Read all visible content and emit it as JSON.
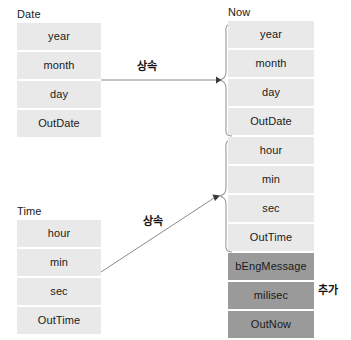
{
  "diagram": {
    "title_date": "Date",
    "title_time": "Time",
    "title_now": "Now"
  },
  "date_class": {
    "name": "Date",
    "fields": [
      {
        "label": "year"
      },
      {
        "label": "month"
      },
      {
        "label": "day"
      },
      {
        "label": "OutDate"
      }
    ]
  },
  "time_class": {
    "name": "Time",
    "fields": [
      {
        "label": "hour"
      },
      {
        "label": "min"
      },
      {
        "label": "sec"
      },
      {
        "label": "OutTime"
      }
    ]
  },
  "now_class": {
    "name": "Now",
    "inherited_from_date": [
      {
        "label": "year"
      },
      {
        "label": "month"
      },
      {
        "label": "day"
      },
      {
        "label": "OutDate"
      }
    ],
    "inherited_from_time": [
      {
        "label": "hour"
      },
      {
        "label": "min"
      },
      {
        "label": "sec"
      },
      {
        "label": "OutTime"
      }
    ],
    "added": [
      {
        "label": "bEngMessage"
      },
      {
        "label": "milisec"
      },
      {
        "label": "OutNow"
      }
    ]
  },
  "edges": [
    {
      "label": "상속"
    },
    {
      "label": "상속"
    }
  ],
  "annotations": {
    "added_label": "추가"
  },
  "colors": {
    "field_fill": "#e9e9e9",
    "added_fill": "#9a9a9a",
    "text": "#1a1a1a",
    "line": "#808080",
    "background": "#ffffff"
  }
}
